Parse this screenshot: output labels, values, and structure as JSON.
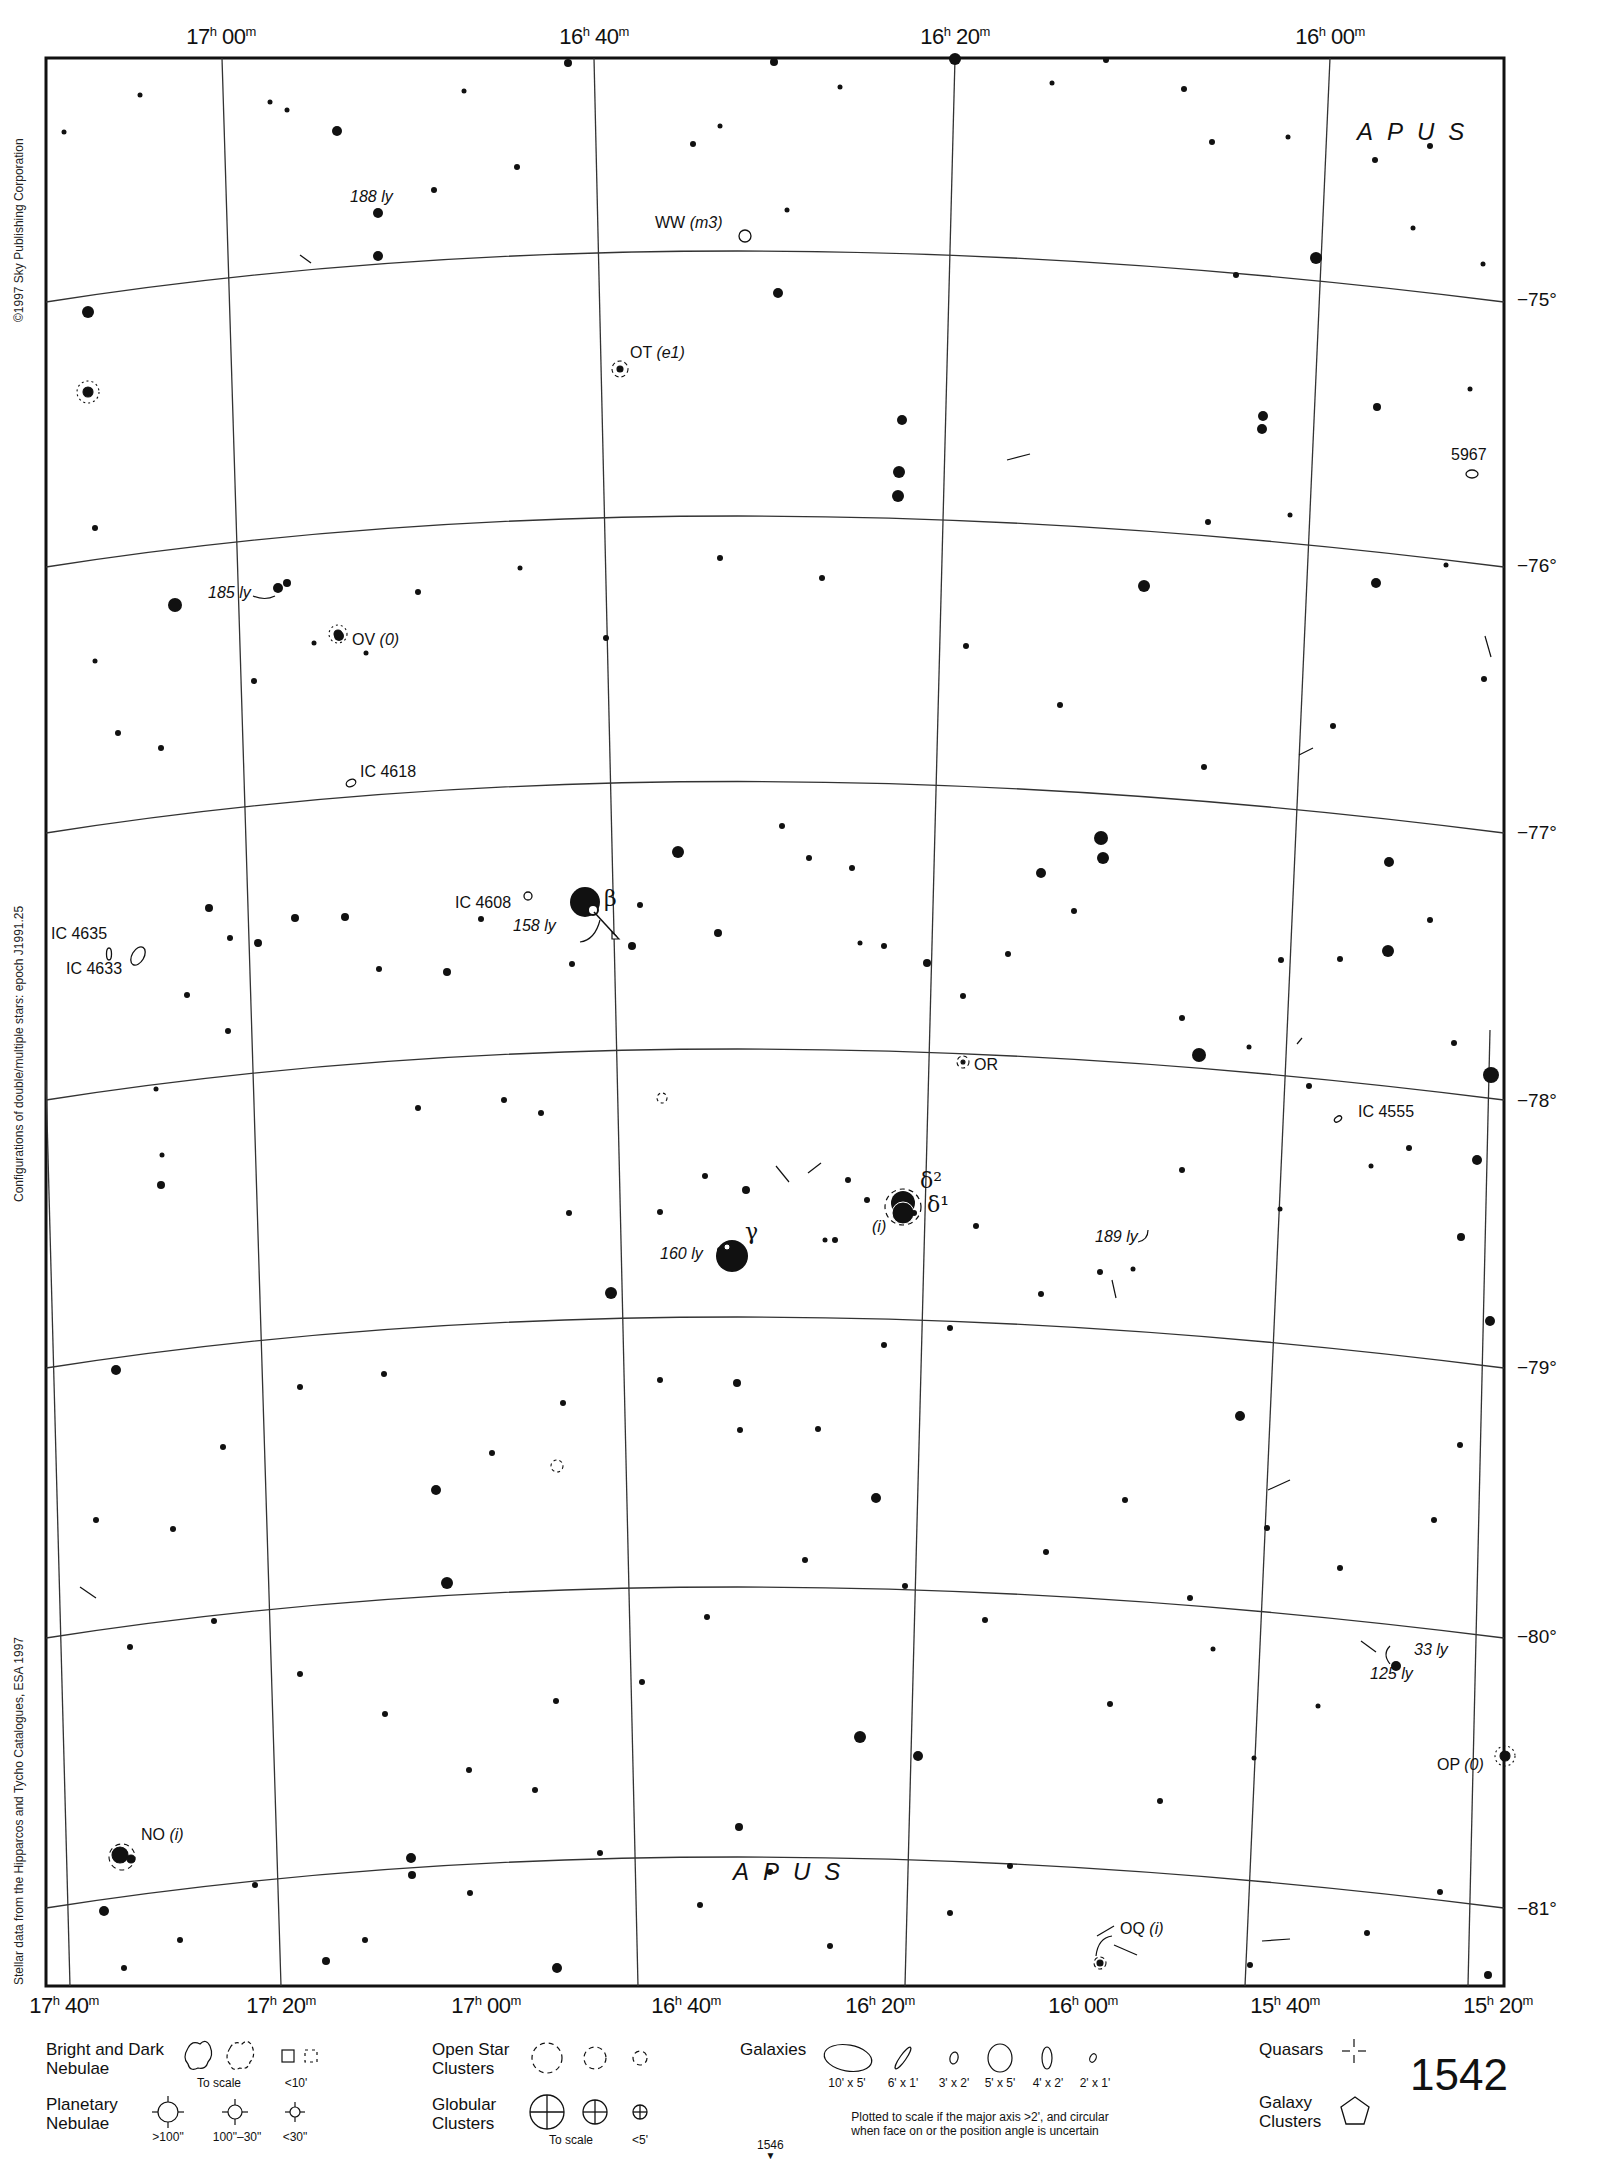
{
  "chart": {
    "constellation": "APUS",
    "page_number": "1542",
    "adjacent_page": "1546",
    "copyright": "©1997 Sky Publishing Corporation",
    "epoch_note": "Configurations of double/multiple stars: epoch J1991.25",
    "source_note": "Stellar data from the Hipparcos and Tycho Catalogues, ESA 1997"
  },
  "ra_top": [
    {
      "h": "17",
      "m": "00"
    },
    {
      "h": "16",
      "m": "40"
    },
    {
      "h": "16",
      "m": "20"
    },
    {
      "h": "16",
      "m": "00"
    }
  ],
  "ra_bottom": [
    {
      "h": "17",
      "m": "40"
    },
    {
      "h": "17",
      "m": "20"
    },
    {
      "h": "17",
      "m": "00"
    },
    {
      "h": "16",
      "m": "40"
    },
    {
      "h": "16",
      "m": "20"
    },
    {
      "h": "16",
      "m": "00"
    },
    {
      "h": "15",
      "m": "40"
    },
    {
      "h": "15",
      "m": "20"
    }
  ],
  "dec": [
    "−75°",
    "−76°",
    "−77°",
    "−78°",
    "−79°",
    "−80°",
    "−81°"
  ],
  "objects": {
    "ww": {
      "name": "WW",
      "note": "(m3)"
    },
    "ot": {
      "name": "OT",
      "note": "(e1)"
    },
    "ov": {
      "name": "OV",
      "note": "(0)"
    },
    "or": {
      "name": "OR"
    },
    "op": {
      "name": "OP",
      "note": "(0)"
    },
    "no": {
      "name": "NO",
      "note": "(i)"
    },
    "oq": {
      "name": "OQ",
      "note": "(i)"
    },
    "delta_note": "(i)",
    "ic4618": "IC 4618",
    "ic4608": "IC 4608",
    "ic4635": "IC 4635",
    "ic4633": "IC 4633",
    "ic4555": "IC 4555",
    "ngc5967": "5967",
    "beta": "β",
    "gamma": "γ",
    "delta2": "δ²",
    "delta1": "δ¹"
  },
  "distances": {
    "d188": "188 ly",
    "d185": "185 ly",
    "d158": "158 ly",
    "d160": "160 ly",
    "d189": "189 ly",
    "d33": "33 ly",
    "d125": "125 ly"
  },
  "legend": {
    "nebulae_title": "Bright and Dark\nNebulae",
    "nebulae_to_scale": "To scale",
    "nebulae_small": "<10'",
    "planetary_title": "Planetary\nNebulae",
    "planetary_sizes": [
      ">100\"",
      "100\"–30\"",
      "<30\""
    ],
    "open_title": "Open Star\nClusters",
    "globular_title": "Globular\nClusters",
    "globular_to_scale": "To scale",
    "globular_small": "<5'",
    "galaxies_title": "Galaxies",
    "galaxy_sizes": [
      "10' x 5'",
      "6' x 1'",
      "3' x 2'",
      "5' x 5'",
      "4' x 2'",
      "2' x 1'"
    ],
    "galaxies_note": "Plotted to scale if the major axis >2', and circular\nwhen face on or the position angle is uncertain",
    "quasars_title": "Quasars",
    "galaxy_clusters_title": "Galaxy\nClusters"
  }
}
